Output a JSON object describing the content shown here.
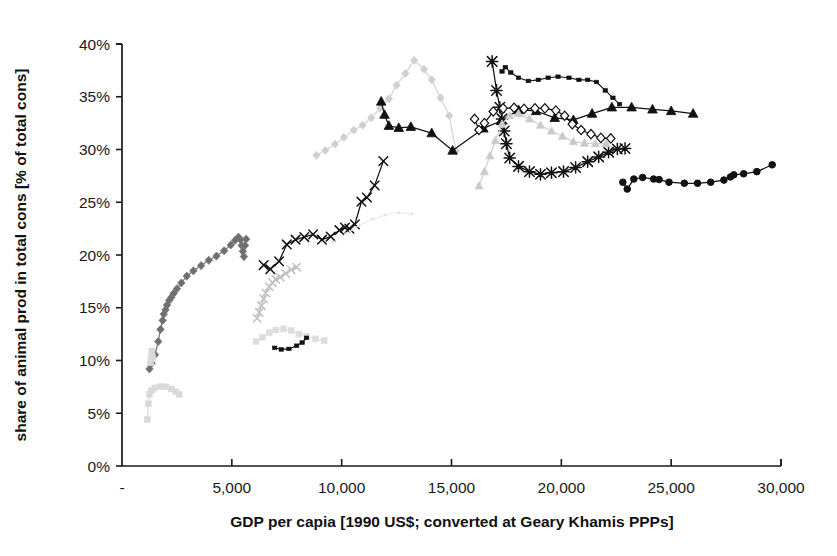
{
  "chart_data": {
    "type": "scatter",
    "title": "",
    "xlabel": "GDP per capia [1990 US$; converted at Geary Khamis PPPs]",
    "ylabel": "share of animal prod in total cons [% of total cons]",
    "xlim": [
      0,
      30000
    ],
    "ylim": [
      0,
      0.4
    ],
    "xticks": [
      0,
      5000,
      10000,
      15000,
      20000,
      25000,
      30000
    ],
    "xticklabels": [
      "-",
      "5,000",
      "10,000",
      "15,000",
      "20,000",
      "25,000",
      "30,000"
    ],
    "yticks": [
      0,
      0.05,
      0.1,
      0.15,
      0.2,
      0.25,
      0.3,
      0.35,
      0.4
    ],
    "yticklabels": [
      "0%",
      "5%",
      "10%",
      "15%",
      "20%",
      "25%",
      "30%",
      "35%",
      "40%"
    ],
    "grid": false,
    "legend": "none",
    "series": [
      {
        "name": "series-light-gray-diamonds-peak",
        "marker": "diamond",
        "color": "#cfcfcf",
        "linecolor": "#d5d5d5",
        "markersize": 6,
        "points": [
          [
            8850,
            0.2945
          ],
          [
            9250,
            0.299
          ],
          [
            9700,
            0.305
          ],
          [
            10100,
            0.3115
          ],
          [
            10550,
            0.3185
          ],
          [
            10950,
            0.323
          ],
          [
            11350,
            0.33
          ],
          [
            11750,
            0.339
          ],
          [
            12150,
            0.348
          ],
          [
            12500,
            0.361
          ],
          [
            12900,
            0.372
          ],
          [
            13300,
            0.3845
          ],
          [
            13750,
            0.376
          ],
          [
            14100,
            0.366
          ],
          [
            14500,
            0.349
          ],
          [
            14900,
            0.332
          ],
          [
            15200,
            0.2985
          ]
        ]
      },
      {
        "name": "series-black-triangles",
        "marker": "triangle",
        "color": "#111111",
        "linecolor": "#111111",
        "markersize": 7,
        "points": [
          [
            11800,
            0.3455
          ],
          [
            11950,
            0.333
          ],
          [
            12150,
            0.3225
          ],
          [
            12600,
            0.3205
          ],
          [
            13150,
            0.3215
          ],
          [
            14100,
            0.3155
          ],
          [
            15050,
            0.299
          ],
          [
            16450,
            0.32
          ],
          [
            17250,
            0.327
          ],
          [
            18050,
            0.3375
          ],
          [
            18850,
            0.3365
          ],
          [
            19700,
            0.33
          ],
          [
            20550,
            0.328
          ],
          [
            21400,
            0.334
          ],
          [
            22300,
            0.34
          ],
          [
            23200,
            0.34
          ],
          [
            24150,
            0.338
          ],
          [
            25000,
            0.3365
          ],
          [
            26000,
            0.334
          ]
        ]
      },
      {
        "name": "series-black-x-crosses",
        "marker": "cross",
        "color": "#111111",
        "linecolor": "#111111",
        "markersize": 7,
        "points": [
          [
            6450,
            0.1905
          ],
          [
            6750,
            0.1865
          ],
          [
            7150,
            0.194
          ],
          [
            7500,
            0.21
          ],
          [
            7900,
            0.2145
          ],
          [
            8300,
            0.217
          ],
          [
            8700,
            0.2195
          ],
          [
            9100,
            0.2145
          ],
          [
            9500,
            0.2175
          ],
          [
            9900,
            0.2235
          ],
          [
            10150,
            0.226
          ],
          [
            10350,
            0.225
          ],
          [
            10600,
            0.229
          ],
          [
            10900,
            0.2505
          ],
          [
            11150,
            0.2545
          ],
          [
            11500,
            0.266
          ],
          [
            11900,
            0.289
          ]
        ]
      },
      {
        "name": "series-black-stars",
        "marker": "star",
        "color": "#111111",
        "linecolor": "#111111",
        "markersize": 7,
        "points": [
          [
            16850,
            0.3835
          ],
          [
            17050,
            0.356
          ],
          [
            17200,
            0.34
          ],
          [
            17300,
            0.329
          ],
          [
            17400,
            0.3175
          ],
          [
            17500,
            0.3055
          ],
          [
            17650,
            0.292
          ],
          [
            18050,
            0.284
          ],
          [
            18550,
            0.279
          ],
          [
            19050,
            0.2765
          ],
          [
            19550,
            0.278
          ],
          [
            20100,
            0.279
          ],
          [
            20650,
            0.283
          ],
          [
            21200,
            0.2885
          ],
          [
            21700,
            0.293
          ],
          [
            22150,
            0.2975
          ],
          [
            22550,
            0.3005
          ],
          [
            22900,
            0.301
          ]
        ]
      },
      {
        "name": "series-open-diamonds",
        "marker": "open-diamond",
        "color": "#ffffff",
        "linecolor": "#111111",
        "markersize": 6,
        "points": [
          [
            16050,
            0.329
          ],
          [
            16250,
            0.3185
          ],
          [
            16500,
            0.325
          ],
          [
            16900,
            0.336
          ],
          [
            17350,
            0.339
          ],
          [
            17850,
            0.3395
          ],
          [
            18300,
            0.3385
          ],
          [
            18800,
            0.339
          ],
          [
            19250,
            0.339
          ],
          [
            19750,
            0.337
          ],
          [
            20150,
            0.332
          ],
          [
            20500,
            0.324
          ],
          [
            20900,
            0.3185
          ],
          [
            21350,
            0.3145
          ],
          [
            21800,
            0.311
          ],
          [
            22250,
            0.3105
          ]
        ]
      },
      {
        "name": "series-black-dash-squares",
        "marker": "small-square",
        "color": "#111111",
        "linecolor": "#111111",
        "markersize": 4,
        "points": [
          [
            17300,
            0.374
          ],
          [
            17450,
            0.378
          ],
          [
            17700,
            0.373
          ],
          [
            18050,
            0.368
          ],
          [
            18500,
            0.365
          ],
          [
            18950,
            0.366
          ],
          [
            19400,
            0.368
          ],
          [
            19850,
            0.369
          ],
          [
            20350,
            0.368
          ],
          [
            20800,
            0.366
          ],
          [
            21200,
            0.366
          ],
          [
            21600,
            0.364
          ],
          [
            22000,
            0.356
          ],
          [
            22350,
            0.349
          ],
          [
            22650,
            0.343
          ]
        ]
      },
      {
        "name": "series-black-circles",
        "marker": "circle",
        "color": "#111111",
        "linecolor": "#111111",
        "markersize": 6,
        "points": [
          [
            22800,
            0.269
          ],
          [
            23000,
            0.2625
          ],
          [
            23300,
            0.272
          ],
          [
            23700,
            0.2735
          ],
          [
            24200,
            0.272
          ],
          [
            24450,
            0.2715
          ],
          [
            24900,
            0.269
          ],
          [
            25600,
            0.268
          ],
          [
            26200,
            0.268
          ],
          [
            26800,
            0.269
          ],
          [
            27400,
            0.271
          ],
          [
            27700,
            0.274
          ],
          [
            27850,
            0.276
          ],
          [
            28300,
            0.277
          ],
          [
            28900,
            0.279
          ],
          [
            29600,
            0.2855
          ]
        ]
      },
      {
        "name": "series-light-gray-triangles",
        "marker": "triangle",
        "color": "#c9c9c9",
        "linecolor": "#d0d0d0",
        "markersize": 6,
        "points": [
          [
            16250,
            0.2655
          ],
          [
            16500,
            0.279
          ],
          [
            16750,
            0.294
          ],
          [
            17000,
            0.3085
          ],
          [
            17300,
            0.324
          ],
          [
            17650,
            0.332
          ],
          [
            18050,
            0.334
          ],
          [
            18550,
            0.329
          ],
          [
            19050,
            0.323
          ],
          [
            19550,
            0.3175
          ],
          [
            20050,
            0.3125
          ],
          [
            20550,
            0.3075
          ],
          [
            21050,
            0.306
          ],
          [
            21550,
            0.3055
          ],
          [
            22050,
            0.3055
          ]
        ]
      },
      {
        "name": "series-dark-gray-diamonds-left",
        "marker": "diamond",
        "color": "#6e6e6e",
        "linecolor": "#7a7a7a",
        "markersize": 6,
        "points": [
          [
            1250,
            0.092
          ],
          [
            1350,
            0.0975
          ],
          [
            1500,
            0.1055
          ],
          [
            1650,
            0.118
          ],
          [
            1750,
            0.1295
          ],
          [
            1850,
            0.138
          ],
          [
            1900,
            0.144
          ],
          [
            1980,
            0.148
          ],
          [
            2050,
            0.1525
          ],
          [
            2150,
            0.157
          ],
          [
            2250,
            0.16
          ],
          [
            2350,
            0.1635
          ],
          [
            2500,
            0.168
          ],
          [
            2700,
            0.1735
          ],
          [
            2950,
            0.18
          ],
          [
            3250,
            0.185
          ],
          [
            3600,
            0.19
          ],
          [
            3950,
            0.195
          ],
          [
            4300,
            0.199
          ],
          [
            4650,
            0.204
          ],
          [
            4950,
            0.2095
          ],
          [
            5150,
            0.214
          ],
          [
            5300,
            0.217
          ],
          [
            5400,
            0.2145
          ],
          [
            5450,
            0.209
          ],
          [
            5500,
            0.2035
          ],
          [
            5550,
            0.1985
          ],
          [
            5600,
            0.209
          ],
          [
            5650,
            0.215
          ]
        ]
      },
      {
        "name": "series-mid-gray-crosses",
        "marker": "cross",
        "color": "#b8b8b8",
        "linecolor": "#c0c0c0",
        "markersize": 6,
        "points": [
          [
            6150,
            0.14
          ],
          [
            6250,
            0.1455
          ],
          [
            6350,
            0.152
          ],
          [
            6450,
            0.1585
          ],
          [
            6550,
            0.164
          ],
          [
            6700,
            0.17
          ],
          [
            6850,
            0.174
          ],
          [
            7000,
            0.177
          ],
          [
            7200,
            0.179
          ],
          [
            7450,
            0.1825
          ],
          [
            7700,
            0.186
          ],
          [
            7950,
            0.1885
          ]
        ]
      },
      {
        "name": "series-pale-gray-low-cluster",
        "marker": "square",
        "color": "#dddddd",
        "linecolor": "#e2e2e2",
        "markersize": 6,
        "points": [
          [
            6100,
            0.118
          ],
          [
            6400,
            0.122
          ],
          [
            6700,
            0.1265
          ],
          [
            7000,
            0.129
          ],
          [
            7350,
            0.13
          ],
          [
            7700,
            0.1285
          ],
          [
            8050,
            0.125
          ],
          [
            8400,
            0.123
          ],
          [
            8800,
            0.1205
          ],
          [
            9200,
            0.119
          ]
        ]
      },
      {
        "name": "series-black-short-low",
        "marker": "small-square",
        "color": "#111111",
        "linecolor": "#111111",
        "markersize": 4,
        "points": [
          [
            6950,
            0.112
          ],
          [
            7250,
            0.1105
          ],
          [
            7600,
            0.111
          ],
          [
            7950,
            0.114
          ],
          [
            8200,
            0.117
          ],
          [
            8400,
            0.1215
          ]
        ]
      },
      {
        "name": "series-pale-gray-bottom-left",
        "marker": "square",
        "color": "#d8d8d8",
        "linecolor": "#dedede",
        "markersize": 6,
        "points": [
          [
            1150,
            0.044
          ],
          [
            1200,
            0.059
          ],
          [
            1250,
            0.068
          ],
          [
            1350,
            0.0715
          ],
          [
            1500,
            0.074
          ],
          [
            1750,
            0.0755
          ],
          [
            2000,
            0.075
          ],
          [
            2250,
            0.073
          ],
          [
            2450,
            0.0705
          ],
          [
            2600,
            0.068
          ]
        ]
      },
      {
        "name": "series-pale-gray-tiny-low",
        "marker": "square",
        "color": "#d8d8d8",
        "linecolor": "#dedede",
        "markersize": 6,
        "points": [
          [
            1300,
            0.098
          ],
          [
            1330,
            0.104
          ],
          [
            1360,
            0.109
          ],
          [
            1390,
            0.103
          ]
        ]
      },
      {
        "name": "series-faint-upper-right-tail",
        "marker": "dot",
        "color": "#e6e6e6",
        "linecolor": "#ececec",
        "markersize": 4,
        "points": [
          [
            9600,
            0.212
          ],
          [
            10200,
            0.22
          ],
          [
            10800,
            0.228
          ],
          [
            11400,
            0.234
          ],
          [
            12000,
            0.238
          ],
          [
            12600,
            0.24
          ],
          [
            13200,
            0.239
          ]
        ]
      }
    ]
  },
  "axes": {
    "x_tick_values": [
      0,
      5000,
      10000,
      15000,
      20000,
      25000,
      30000
    ],
    "y_tick_values": [
      0,
      5,
      10,
      15,
      20,
      25,
      30,
      35,
      40
    ]
  }
}
